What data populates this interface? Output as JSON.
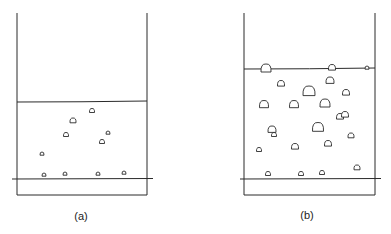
{
  "panels": [
    {
      "id": "a",
      "label": "(a)",
      "container": {
        "left": 17,
        "right": 147,
        "top": 13,
        "bottom": 195
      },
      "surface": {
        "y_left": 102,
        "y_right": 101
      },
      "base_line": {
        "y": 179,
        "x1": 12,
        "x2": 153
      },
      "label_pos": {
        "x": 81,
        "y": 210
      },
      "bubbles": [
        {
          "x": 92,
          "y": 111,
          "r": 2.5
        },
        {
          "x": 73,
          "y": 121,
          "r": 3
        },
        {
          "x": 66,
          "y": 135,
          "r": 2.5
        },
        {
          "x": 108,
          "y": 133,
          "r": 2
        },
        {
          "x": 102,
          "y": 142,
          "r": 2.5
        },
        {
          "x": 42,
          "y": 154,
          "r": 2
        },
        {
          "x": 44,
          "y": 175,
          "r": 2
        },
        {
          "x": 65,
          "y": 174,
          "r": 2
        },
        {
          "x": 98,
          "y": 174,
          "r": 2
        },
        {
          "x": 124,
          "y": 173,
          "r": 2
        }
      ]
    },
    {
      "id": "b",
      "label": "(b)",
      "container": {
        "left": 244,
        "right": 375,
        "top": 13,
        "bottom": 195
      },
      "surface": {
        "y_left": 69,
        "y_right": 68
      },
      "base_line": {
        "y": 179,
        "x1": 240,
        "x2": 381
      },
      "label_pos": {
        "x": 307,
        "y": 209
      },
      "bubbles": [
        {
          "x": 266,
          "y": 69,
          "r": 5
        },
        {
          "x": 332,
          "y": 68,
          "r": 3.5
        },
        {
          "x": 367,
          "y": 68,
          "r": 2
        },
        {
          "x": 281,
          "y": 84,
          "r": 3.5
        },
        {
          "x": 330,
          "y": 81,
          "r": 4
        },
        {
          "x": 309,
          "y": 92,
          "r": 6
        },
        {
          "x": 346,
          "y": 93,
          "r": 3.5
        },
        {
          "x": 264,
          "y": 105,
          "r": 4.5
        },
        {
          "x": 294,
          "y": 105,
          "r": 4.5
        },
        {
          "x": 325,
          "y": 104,
          "r": 5
        },
        {
          "x": 340,
          "y": 117,
          "r": 3.5
        },
        {
          "x": 345,
          "y": 115,
          "r": 3.5
        },
        {
          "x": 272,
          "y": 130,
          "r": 4
        },
        {
          "x": 274,
          "y": 135,
          "r": 2.5
        },
        {
          "x": 318,
          "y": 128,
          "r": 5.5
        },
        {
          "x": 351,
          "y": 136,
          "r": 3
        },
        {
          "x": 259,
          "y": 150,
          "r": 2.5
        },
        {
          "x": 295,
          "y": 147,
          "r": 3.5
        },
        {
          "x": 328,
          "y": 144,
          "r": 3.5
        },
        {
          "x": 268,
          "y": 174,
          "r": 2.5
        },
        {
          "x": 301,
          "y": 174,
          "r": 2.5
        },
        {
          "x": 322,
          "y": 173,
          "r": 2.5
        },
        {
          "x": 357,
          "y": 168,
          "r": 3
        }
      ]
    }
  ],
  "colors": {
    "stroke": "#2a2a2a",
    "background": "#ffffff"
  }
}
